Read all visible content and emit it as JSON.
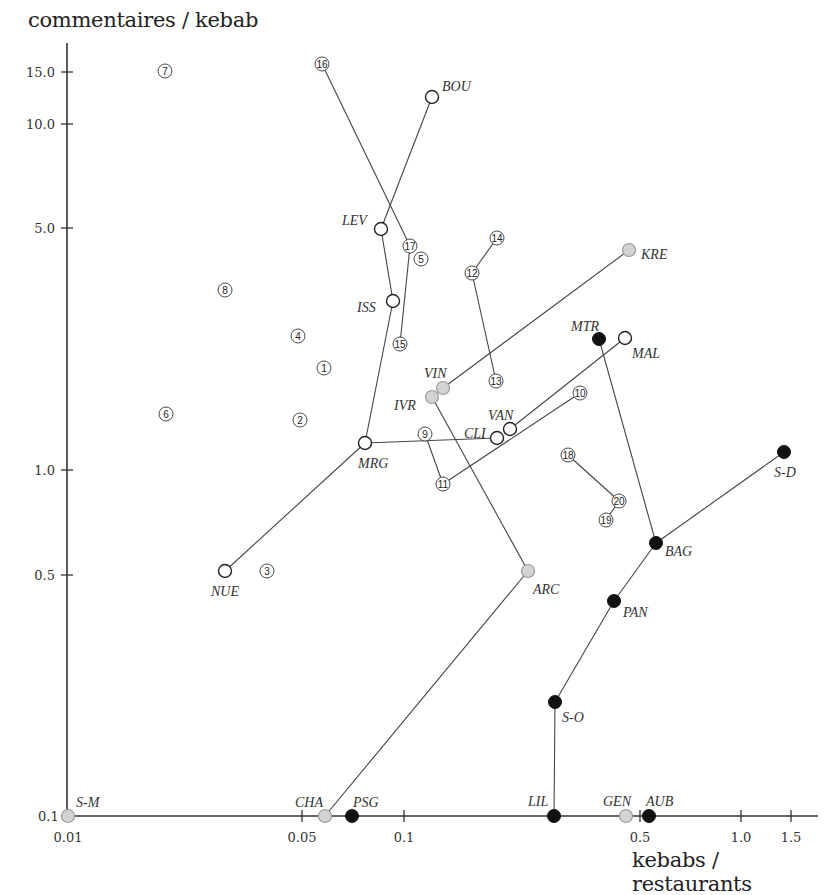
{
  "chart_data": {
    "type": "scatter",
    "title": "",
    "xlabel": "kebabs / restaurants",
    "ylabel": "commentaires / kebab",
    "xscale": "log",
    "yscale": "log",
    "xlim": [
      0.01,
      1.8
    ],
    "ylim": [
      0.1,
      16
    ],
    "grid": false,
    "x_ticks": [
      {
        "label": "0.01",
        "value": 0.01,
        "px": 68
      },
      {
        "label": "0.05",
        "value": 0.05,
        "px": 302
      },
      {
        "label": "0.1",
        "value": 0.1,
        "px": 404
      },
      {
        "label": "0.5",
        "value": 0.5,
        "px": 640
      },
      {
        "label": "1.0",
        "value": 1.0,
        "px": 741
      },
      {
        "label": "1.5",
        "value": 1.5,
        "px": 791
      }
    ],
    "y_ticks": [
      {
        "label": "15.0",
        "value": 15.0,
        "py": 72
      },
      {
        "label": "10.0",
        "value": 10.0,
        "py": 124
      },
      {
        "label": "5.0",
        "value": 5.0,
        "py": 228
      },
      {
        "label": "1.0",
        "value": 1.0,
        "py": 470
      },
      {
        "label": "0.5",
        "value": 0.5,
        "py": 575
      },
      {
        "label": "0.1",
        "value": 0.1,
        "py": 816
      }
    ],
    "legend": {
      "categories": [
        {
          "style": "open-circle",
          "meaning": "open white circle"
        },
        {
          "style": "gray-circle",
          "meaning": "gray filled circle"
        },
        {
          "style": "black-circle",
          "meaning": "black filled circle"
        },
        {
          "style": "numbered",
          "meaning": "numbered circle (arrondissement)"
        }
      ]
    },
    "series": [
      {
        "name": "open",
        "style": "open-circle",
        "points": [
          {
            "label": "BOU",
            "x": 0.121,
            "y": 12.0,
            "px": 432,
            "py": 97,
            "lx": 442,
            "ly": 91
          },
          {
            "label": "LEV",
            "x": 0.086,
            "y": 5.0,
            "px": 381,
            "py": 229,
            "lx": 342,
            "ly": 225
          },
          {
            "label": "ISS",
            "x": 0.093,
            "y": 3.09,
            "px": 393,
            "py": 301,
            "lx": 357,
            "ly": 312
          },
          {
            "label": "MRG",
            "x": 0.077,
            "y": 1.19,
            "px": 365,
            "py": 443,
            "lx": 358,
            "ly": 468
          },
          {
            "label": "NUE",
            "x": 0.029,
            "y": 0.51,
            "px": 225,
            "py": 571,
            "lx": 211,
            "ly": 596
          },
          {
            "label": "CLI",
            "x": 0.18,
            "y": 1.25,
            "px": 497,
            "py": 438,
            "lx": 464,
            "ly": 438
          },
          {
            "label": "VAN",
            "x": 0.206,
            "y": 1.31,
            "px": 510,
            "py": 429,
            "lx": 488,
            "ly": 420
          },
          {
            "label": "MAL",
            "x": 0.455,
            "y": 2.41,
            "px": 625,
            "py": 338,
            "lx": 632,
            "ly": 358
          }
        ]
      },
      {
        "name": "gray",
        "style": "gray-circle",
        "points": [
          {
            "label": "KRE",
            "x": 0.468,
            "y": 4.34,
            "px": 629,
            "py": 250,
            "lx": 641,
            "ly": 259
          },
          {
            "label": "VIN",
            "x": 0.131,
            "y": 1.73,
            "px": 443,
            "py": 388,
            "lx": 424,
            "ly": 378
          },
          {
            "label": "IVR",
            "x": 0.121,
            "y": 1.63,
            "px": 432,
            "py": 397,
            "lx": 394,
            "ly": 410
          },
          {
            "label": "ARC",
            "x": 0.234,
            "y": 0.51,
            "px": 528,
            "py": 571,
            "lx": 533,
            "ly": 594
          },
          {
            "label": "S-M",
            "x": 0.01,
            "y": 0.1,
            "px": 68,
            "py": 816,
            "lx": 76,
            "ly": 807
          },
          {
            "label": "CHA",
            "x": 0.058,
            "y": 0.1,
            "px": 325,
            "py": 816,
            "lx": 295,
            "ly": 807
          },
          {
            "label": "GEN",
            "x": 0.458,
            "y": 0.1,
            "px": 626,
            "py": 816,
            "lx": 603,
            "ly": 806
          }
        ]
      },
      {
        "name": "black",
        "style": "black-circle",
        "points": [
          {
            "label": "MTR",
            "x": 0.38,
            "y": 2.4,
            "px": 599,
            "py": 339,
            "lx": 571,
            "ly": 331
          },
          {
            "label": "S-D",
            "x": 1.35,
            "y": 1.13,
            "px": 784,
            "py": 452,
            "lx": 774,
            "ly": 477
          },
          {
            "label": "BAG",
            "x": 0.56,
            "y": 0.61,
            "px": 656,
            "py": 543,
            "lx": 665,
            "ly": 556
          },
          {
            "label": "PAN",
            "x": 0.42,
            "y": 0.42,
            "px": 614,
            "py": 601,
            "lx": 623,
            "ly": 617
          },
          {
            "label": "S-O",
            "x": 0.28,
            "y": 0.21,
            "px": 555,
            "py": 702,
            "lx": 562,
            "ly": 722
          },
          {
            "label": "PSG",
            "x": 0.07,
            "y": 0.1,
            "px": 352,
            "py": 816,
            "lx": 353,
            "ly": 807
          },
          {
            "label": "LIL",
            "x": 0.279,
            "y": 0.1,
            "px": 554,
            "py": 816,
            "lx": 528,
            "ly": 806
          },
          {
            "label": "AUB",
            "x": 0.535,
            "y": 0.1,
            "px": 649,
            "py": 816,
            "lx": 646,
            "ly": 806
          }
        ]
      },
      {
        "name": "numbered",
        "style": "numbered",
        "points": [
          {
            "label": "1",
            "x": 0.058,
            "y": 1.98,
            "px": 324,
            "py": 368
          },
          {
            "label": "2",
            "x": 0.049,
            "y": 1.4,
            "px": 300,
            "py": 420
          },
          {
            "label": "3",
            "x": 0.039,
            "y": 0.51,
            "px": 267,
            "py": 571
          },
          {
            "label": "4",
            "x": 0.048,
            "y": 2.44,
            "px": 298,
            "py": 336
          },
          {
            "label": "5",
            "x": 0.112,
            "y": 4.09,
            "px": 421,
            "py": 259
          },
          {
            "label": "6",
            "x": 0.02,
            "y": 1.45,
            "px": 166,
            "py": 414
          },
          {
            "label": "7",
            "x": 0.019,
            "y": 15.0,
            "px": 165,
            "py": 71
          },
          {
            "label": "8",
            "x": 0.029,
            "y": 3.32,
            "px": 225,
            "py": 290
          },
          {
            "label": "9",
            "x": 0.115,
            "y": 1.27,
            "px": 425,
            "py": 434
          },
          {
            "label": "10",
            "x": 0.337,
            "y": 1.67,
            "px": 580,
            "py": 393
          },
          {
            "label": "11",
            "x": 0.13,
            "y": 0.91,
            "px": 443,
            "py": 484
          },
          {
            "label": "12",
            "x": 0.159,
            "y": 3.72,
            "px": 472,
            "py": 273
          },
          {
            "label": "13",
            "x": 0.188,
            "y": 1.81,
            "px": 496,
            "py": 381
          },
          {
            "label": "14",
            "x": 0.189,
            "y": 4.7,
            "px": 497,
            "py": 238
          },
          {
            "label": "15",
            "x": 0.097,
            "y": 2.32,
            "px": 400,
            "py": 344
          },
          {
            "label": "16",
            "x": 0.057,
            "y": 15.0,
            "px": 322,
            "py": 64
          },
          {
            "label": "17",
            "x": 0.104,
            "y": 4.46,
            "px": 410,
            "py": 246
          },
          {
            "label": "18",
            "x": 0.308,
            "y": 1.1,
            "px": 568,
            "py": 455
          },
          {
            "label": "19",
            "x": 0.4,
            "y": 0.72,
            "px": 606,
            "py": 520
          },
          {
            "label": "20",
            "x": 0.437,
            "y": 0.81,
            "px": 619,
            "py": 501
          }
        ]
      }
    ],
    "connections": [
      [
        "BOU",
        "LEV"
      ],
      [
        "LEV",
        "ISS"
      ],
      [
        "ISS",
        "MRG"
      ],
      [
        "MRG",
        "NUE"
      ],
      [
        "MRG",
        "CLI"
      ],
      [
        "VAN",
        "MAL"
      ],
      [
        "VIN",
        "KRE"
      ],
      [
        "IVR",
        "ARC"
      ],
      [
        "ARC",
        "CHA"
      ],
      [
        "MTR",
        "BAG"
      ],
      [
        "BAG",
        "S-D"
      ],
      [
        "BAG",
        "PAN"
      ],
      [
        "PAN",
        "S-O"
      ],
      [
        "S-O",
        "LIL"
      ],
      [
        "16",
        "17"
      ],
      [
        "17",
        "15"
      ],
      [
        "14",
        "12"
      ],
      [
        "12",
        "13"
      ],
      [
        "9",
        "11"
      ],
      [
        "11",
        "10"
      ],
      [
        "18",
        "20"
      ],
      [
        "20",
        "19"
      ]
    ]
  },
  "axes": {
    "ylabel": "commentaires / kebab",
    "xlabel": "kebabs / restaurants"
  },
  "colors": {
    "axis": "#333333",
    "line": "#444444",
    "open_fill": "#ffffff",
    "open_stroke": "#222222",
    "gray_fill": "#d3d3d3",
    "gray_stroke": "#9a9a9a",
    "black_fill": "#111111"
  }
}
